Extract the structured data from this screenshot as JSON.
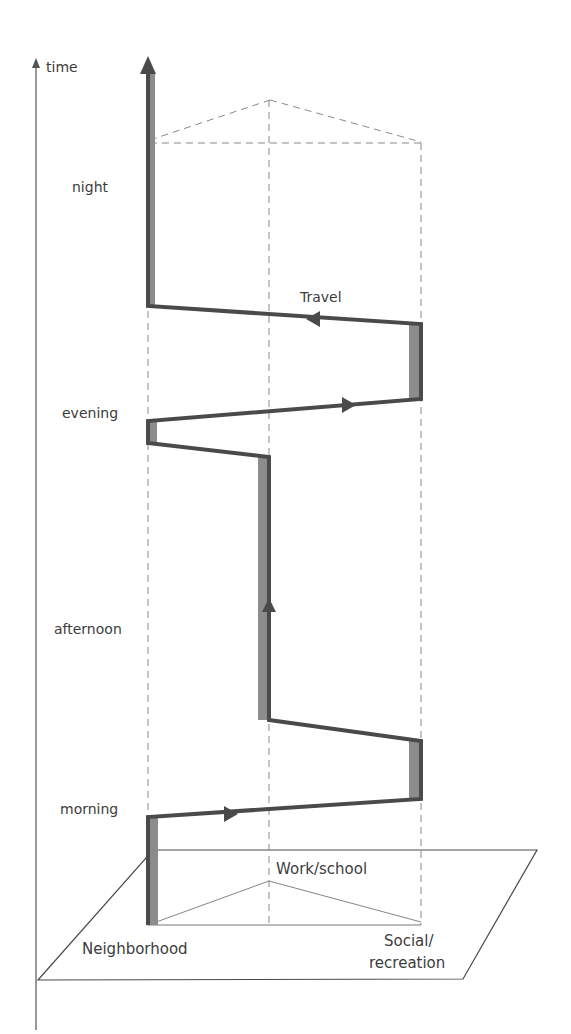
{
  "diagram": {
    "type": "time-geography space-time path",
    "axis_label": "time",
    "time_periods": [
      {
        "label": "night",
        "x": 72,
        "y": 178
      },
      {
        "label": "evening",
        "x": 62,
        "y": 404
      },
      {
        "label": "afternoon",
        "x": 54,
        "y": 620
      },
      {
        "label": "morning",
        "x": 60,
        "y": 800
      }
    ],
    "locations": [
      {
        "label": "Neighborhood",
        "x": 82,
        "y": 940
      },
      {
        "label": "Work/school",
        "x": 276,
        "y": 862
      },
      {
        "label": "Social/",
        "x": 380,
        "y": 936
      },
      {
        "label": "recreation",
        "x": 368,
        "y": 960
      }
    ],
    "path_label": {
      "label": "Travel",
      "x": 300,
      "y": 288
    },
    "colors": {
      "path": "#4a4a4a",
      "stay_fill": "#8c8c8c",
      "dashed": "#8a8a8a",
      "plane": "#4a4a4a"
    }
  }
}
